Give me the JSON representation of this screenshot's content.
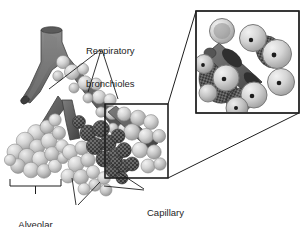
{
  "figure": {
    "kind": "anatomical-illustration",
    "background_color": "#ffffff",
    "ink_color": "#1e1e1e"
  },
  "labels": [
    {
      "id": "respiratory-bronchioles",
      "text": "Respiratory\nbronchioles",
      "line1": "Respiratory",
      "line2": "bronchioles",
      "x": 86,
      "y": 23,
      "align": "left"
    },
    {
      "id": "alveolar-sac",
      "text": "Alveolar\nsac",
      "line1": "Alveolar",
      "line2": "sac",
      "x": 6,
      "y": 197,
      "align": "center"
    },
    {
      "id": "alveoli",
      "text": "Alveoli",
      "line1": "Alveoli",
      "line2": "",
      "x": 64,
      "y": 209,
      "align": "left"
    },
    {
      "id": "capillary-network",
      "text": "Capillary\nnetwork",
      "line1": "Capillary",
      "line2": "network",
      "x": 147,
      "y": 185,
      "align": "left"
    }
  ],
  "colors": {
    "bronchiole_dark": "#6f6f6f",
    "bronchiole_shadow": "#4a4a4a",
    "alveoli_light": "#c9c9c9",
    "alveoli_highlight": "#e6e6e6",
    "capillary_dark": "#4f4f4f",
    "capillary_stipple": "#2b2b2b",
    "outline": "#3a3a3a",
    "box_line": "#1e1e1e"
  },
  "callout": {
    "source_box": {
      "x": 105,
      "y": 104,
      "w": 63,
      "h": 74
    },
    "inset_box": {
      "x": 196,
      "y": 11,
      "w": 103,
      "h": 102
    },
    "leader_from_top": {
      "x1": 168,
      "y1": 104,
      "x2": 196,
      "y2": 11
    },
    "leader_from_bottom": {
      "x1": 168,
      "y1": 178,
      "x2": 299,
      "y2": 113
    }
  },
  "bracket": {
    "id": "alveolar-sac-bracket",
    "x1": 10,
    "x2": 61,
    "y": 186,
    "tick_height": 7,
    "stem_height": 8
  }
}
